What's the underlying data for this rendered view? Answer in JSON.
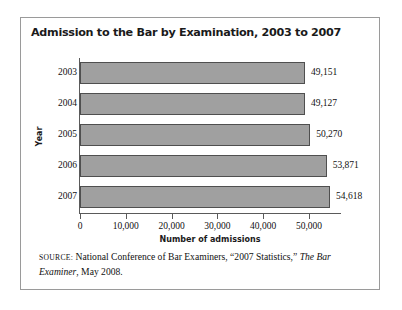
{
  "figure": {
    "title": "Admission to the Bar by Examination, 2003 to 2007",
    "source_label": "SOURCE:",
    "source_text_1": " National Conference of Bar Examiners, “2007 Statistics,” ",
    "source_italic": "The Bar Examiner",
    "source_text_2": ", May 2008."
  },
  "colors": {
    "bar_fill": "#a0a0a0",
    "bar_edge": "#4f4f4f",
    "axis": "#5a5a5a",
    "frame": "#9a9a9a",
    "text": "#111111"
  },
  "chart_data": {
    "type": "bar",
    "orientation": "horizontal",
    "title": "Admission to the Bar by Examination, 2003 to 2007",
    "xlabel": "Number of admissions",
    "ylabel": "Year",
    "categories": [
      "2003",
      "2004",
      "2005",
      "2006",
      "2007"
    ],
    "values": [
      49151,
      49127,
      50270,
      53871,
      54618
    ],
    "value_labels": [
      "49,151",
      "49,127",
      "50,270",
      "53,871",
      "54,618"
    ],
    "xlim": [
      0,
      57000
    ],
    "xticks": [
      0,
      10000,
      20000,
      30000,
      40000,
      50000
    ],
    "xtick_labels": [
      "0",
      "10,000",
      "20,000",
      "30,000",
      "40,000",
      "50,000"
    ],
    "grid": false,
    "legend": false
  }
}
